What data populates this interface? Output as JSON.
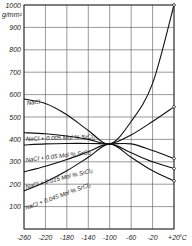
{
  "chart_data": {
    "type": "line",
    "title": "",
    "xlabel": "°C",
    "ylabel": "g/mm²",
    "xlim": [
      -260,
      20
    ],
    "ylim": [
      0,
      1000
    ],
    "grid": true,
    "x_ticks": [
      "-260",
      "-220",
      "-180",
      "-140",
      "-100",
      "-60",
      "-20",
      "+20 °C"
    ],
    "y_ticks": [
      "100",
      "200",
      "300",
      "400",
      "500",
      "600",
      "700",
      "800",
      "900",
      "1000"
    ],
    "y_unit": "g/mm²",
    "x": [
      -260,
      -220,
      -180,
      -140,
      -100,
      -60,
      -20,
      20
    ],
    "series": [
      {
        "name": "NaCl",
        "values": [
          580,
          560,
          510,
          440,
          380,
          480,
          650,
          1000
        ]
      },
      {
        "name": "NaCl + 0.005 Mol % SrCl2",
        "values": [
          430,
          425,
          415,
          400,
          380,
          420,
          480,
          545
        ]
      },
      {
        "name": "NaCl + 0.05 Mol % SrCl2",
        "values": [
          375,
          380,
          382,
          382,
          380,
          380,
          350,
          315
        ]
      },
      {
        "name": "NaCl + 0.015 Mol % SrCl2",
        "values": [
          255,
          280,
          310,
          345,
          380,
          340,
          300,
          270
        ]
      },
      {
        "name": "NaCl + 0.045 Mol % SrCl2",
        "values": [
          170,
          210,
          260,
          320,
          380,
          320,
          260,
          215
        ]
      }
    ]
  },
  "labels": {
    "y_unit": "g/mm²",
    "x_unit": "°C",
    "s0": "NaCl",
    "s1": "NaCl + 0.005 Mol % SrCl₂",
    "s2": "NaCl + 0.05 Mol % SrCl₂",
    "s3": "NaCl + 0.015 Mol % SrCl₂",
    "s4": "NaCl + 0.045 Mol % SrCl₂"
  }
}
